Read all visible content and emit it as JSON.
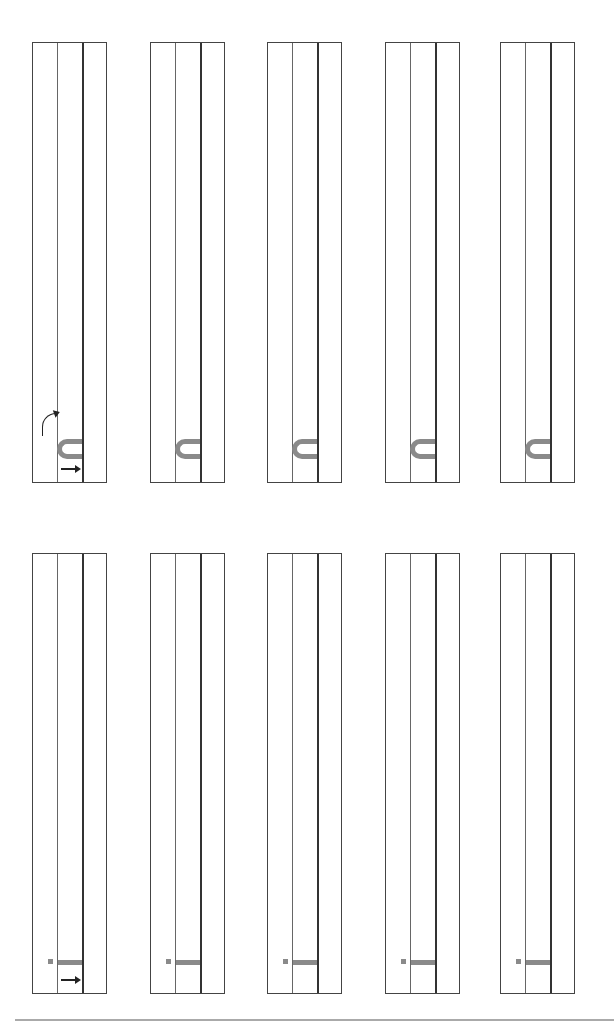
{
  "worksheet": {
    "rows": [
      {
        "letter": "n",
        "box_top": 42,
        "boxes": [
          {
            "left": 32,
            "guide_arrows": true
          },
          {
            "left": 150,
            "guide_arrows": false
          },
          {
            "left": 267,
            "guide_arrows": false
          },
          {
            "left": 385,
            "guide_arrows": false
          },
          {
            "left": 500,
            "guide_arrows": false
          }
        ]
      },
      {
        "letter": "i",
        "box_top": 553,
        "boxes": [
          {
            "left": 32,
            "guide_arrows": true
          },
          {
            "left": 150,
            "guide_arrows": false
          },
          {
            "left": 267,
            "guide_arrows": false
          },
          {
            "left": 385,
            "guide_arrows": false
          },
          {
            "left": 500,
            "guide_arrows": false
          }
        ]
      }
    ],
    "colors": {
      "line": "#444444",
      "glyph": "#8a8a8a",
      "arrow": "#222222",
      "footer": "#aaaaaa"
    }
  }
}
